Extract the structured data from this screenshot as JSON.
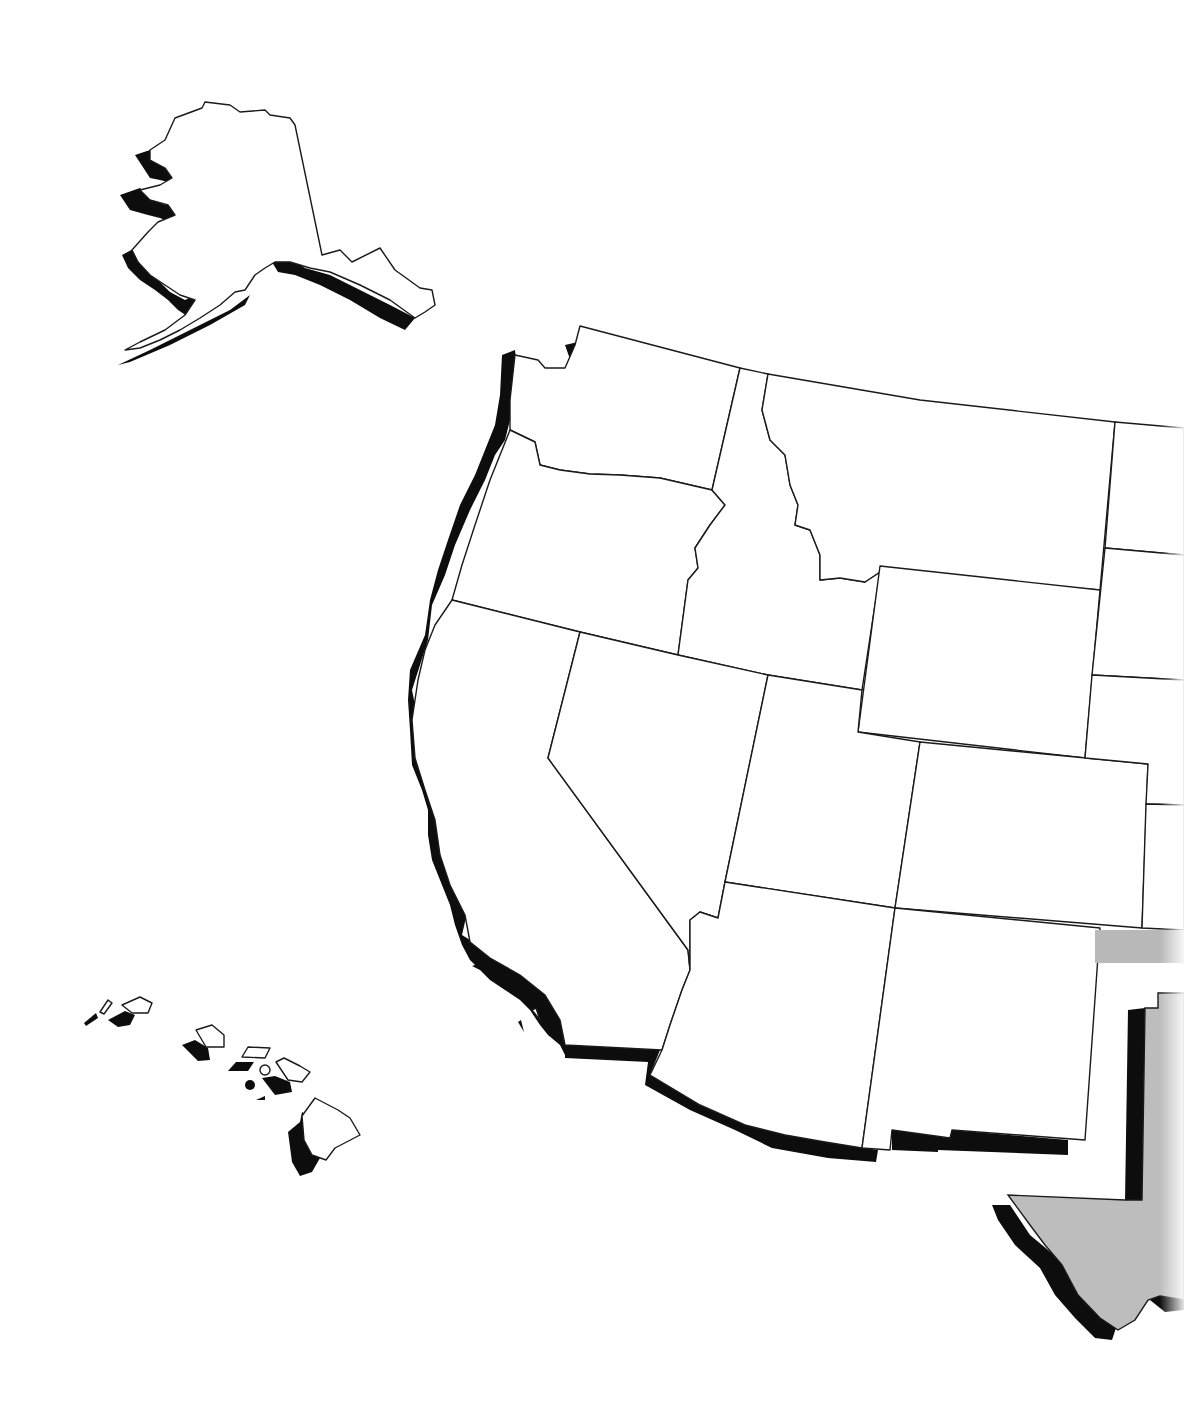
{
  "map": {
    "type": "outline-map",
    "region": "Western United States",
    "labels": [],
    "colors": {
      "background": "#ffffff",
      "state_fill": "#ffffff",
      "state_outline": "#1a1a1a",
      "extrusion_shadow": "#0d0d0d",
      "highlight_state_fill": "#bdbdbd",
      "gray_bar": "#b8b8b8"
    },
    "states_shown": [
      "Alaska",
      "Hawaii",
      "Washington",
      "Oregon",
      "California",
      "Idaho",
      "Nevada",
      "Montana",
      "Wyoming",
      "Utah",
      "Colorado",
      "Arizona",
      "New Mexico",
      "Texas (partial, gray)",
      "North Dakota (partial)",
      "South Dakota (partial)",
      "Nebraska (partial)",
      "Kansas (partial)",
      "Oklahoma panhandle (partial, gray)"
    ]
  }
}
